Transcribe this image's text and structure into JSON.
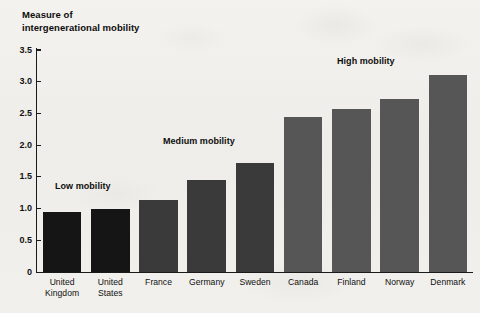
{
  "chart_data": {
    "type": "bar",
    "title": "",
    "ylabel": "Measure of intergenerational mobility",
    "xlabel": "",
    "ylim": [
      0,
      3.5
    ],
    "yticks": [
      "0",
      "0.5",
      "1.0",
      "1.5",
      "2.0",
      "2.5",
      "3.0",
      "3.5"
    ],
    "ytick_values": [
      0,
      0.5,
      1.0,
      1.5,
      2.0,
      2.5,
      3.0,
      3.5
    ],
    "grid": false,
    "legend": "none",
    "categories": [
      "United\nKingdom",
      "United\nStates",
      "France",
      "Germany",
      "Sweden",
      "Canada",
      "Finland",
      "Norway",
      "Denmark"
    ],
    "values": [
      0.95,
      1.0,
      1.13,
      1.45,
      1.72,
      2.45,
      2.57,
      2.72,
      3.1
    ],
    "bar_colors": [
      "#151515",
      "#151515",
      "#3a3a3a",
      "#3a3a3a",
      "#3a3a3a",
      "#565656",
      "#565656",
      "#565656",
      "#565656"
    ],
    "annotations": [
      {
        "text": "Low mobility",
        "x": 55,
        "y": 181
      },
      {
        "text": "Medium mobility",
        "x": 163,
        "y": 136
      },
      {
        "text": "High mobility",
        "x": 337,
        "y": 56
      }
    ]
  },
  "figure": {
    "axis_title": "Measure of\nintergenerational mobility",
    "background_color": "#f1efeb",
    "axis_color": "#1a1a1a"
  }
}
